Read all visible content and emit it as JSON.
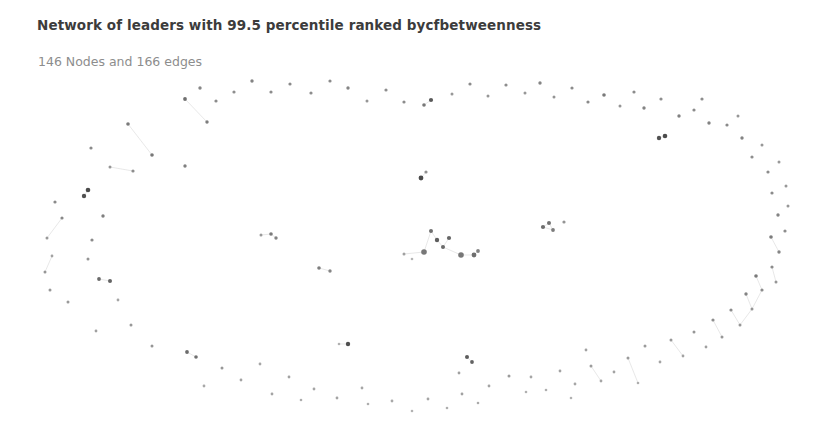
{
  "chart_data": {
    "type": "scatter",
    "title": "Network of leaders with 99.5 percentile ranked bycfbetweenness",
    "subtitle": "146 Nodes and 166 edges",
    "node_count": 146,
    "edge_count": 166,
    "layout": "circular-ring-with-central-cluster",
    "xlabel": "",
    "ylabel": "",
    "xlim": [
      0,
      830
    ],
    "ylim": [
      0,
      439
    ],
    "grid": false,
    "legend": "none",
    "node_color": "#6b6b6b",
    "node_color_light": "#b8b8b8",
    "edge_color": "#dedede",
    "background_color": "#ffffff",
    "nodes": [
      {
        "x": 128,
        "y": 124,
        "r": 1.8,
        "c": "#7a7a7a"
      },
      {
        "x": 91,
        "y": 148,
        "r": 1.6,
        "c": "#8a8a8a"
      },
      {
        "x": 185,
        "y": 99,
        "r": 1.9,
        "c": "#6f6f6f"
      },
      {
        "x": 207,
        "y": 122,
        "r": 1.7,
        "c": "#7d7d7d"
      },
      {
        "x": 152,
        "y": 155,
        "r": 1.8,
        "c": "#787878"
      },
      {
        "x": 110,
        "y": 167,
        "r": 1.5,
        "c": "#969696"
      },
      {
        "x": 185,
        "y": 166,
        "r": 1.7,
        "c": "#808080"
      },
      {
        "x": 133,
        "y": 171,
        "r": 1.6,
        "c": "#8d8d8d"
      },
      {
        "x": 88,
        "y": 190,
        "r": 2.3,
        "c": "#4a4a4a"
      },
      {
        "x": 84,
        "y": 196,
        "r": 2.2,
        "c": "#505050"
      },
      {
        "x": 55,
        "y": 202,
        "r": 1.6,
        "c": "#8a8a8a"
      },
      {
        "x": 62,
        "y": 218,
        "r": 1.6,
        "c": "#888888"
      },
      {
        "x": 103,
        "y": 216,
        "r": 1.7,
        "c": "#7f7f7f"
      },
      {
        "x": 47,
        "y": 238,
        "r": 1.5,
        "c": "#999999"
      },
      {
        "x": 92,
        "y": 240,
        "r": 1.6,
        "c": "#8b8b8b"
      },
      {
        "x": 52,
        "y": 256,
        "r": 1.4,
        "c": "#a2a2a2"
      },
      {
        "x": 88,
        "y": 259,
        "r": 1.5,
        "c": "#949494"
      },
      {
        "x": 45,
        "y": 272,
        "r": 1.5,
        "c": "#969696"
      },
      {
        "x": 99,
        "y": 279,
        "r": 1.9,
        "c": "#6a6a6a"
      },
      {
        "x": 110,
        "y": 281,
        "r": 2.0,
        "c": "#646464"
      },
      {
        "x": 50,
        "y": 290,
        "r": 1.5,
        "c": "#989898"
      },
      {
        "x": 68,
        "y": 302,
        "r": 1.5,
        "c": "#9a9a9a"
      },
      {
        "x": 118,
        "y": 300,
        "r": 1.4,
        "c": "#a5a5a5"
      },
      {
        "x": 131,
        "y": 325,
        "r": 1.5,
        "c": "#989898"
      },
      {
        "x": 96,
        "y": 331,
        "r": 1.4,
        "c": "#a0a0a0"
      },
      {
        "x": 152,
        "y": 346,
        "r": 1.5,
        "c": "#959595"
      },
      {
        "x": 187,
        "y": 352,
        "r": 1.9,
        "c": "#6c6c6c"
      },
      {
        "x": 196,
        "y": 357,
        "r": 1.8,
        "c": "#707070"
      },
      {
        "x": 222,
        "y": 368,
        "r": 1.5,
        "c": "#989898"
      },
      {
        "x": 241,
        "y": 380,
        "r": 1.4,
        "c": "#a3a3a3"
      },
      {
        "x": 204,
        "y": 386,
        "r": 1.4,
        "c": "#a8a8a8"
      },
      {
        "x": 272,
        "y": 394,
        "r": 1.4,
        "c": "#a4a4a4"
      },
      {
        "x": 260,
        "y": 364,
        "r": 1.4,
        "c": "#a6a6a6"
      },
      {
        "x": 289,
        "y": 377,
        "r": 1.4,
        "c": "#a2a2a2"
      },
      {
        "x": 314,
        "y": 389,
        "r": 1.4,
        "c": "#a5a5a5"
      },
      {
        "x": 301,
        "y": 400,
        "r": 1.3,
        "c": "#adadad"
      },
      {
        "x": 337,
        "y": 398,
        "r": 1.4,
        "c": "#a4a4a4"
      },
      {
        "x": 348,
        "y": 344,
        "r": 2.2,
        "c": "#4f4f4f"
      },
      {
        "x": 339,
        "y": 344,
        "r": 1.3,
        "c": "#b0b0b0"
      },
      {
        "x": 368,
        "y": 404,
        "r": 1.3,
        "c": "#aeaeae"
      },
      {
        "x": 362,
        "y": 388,
        "r": 1.4,
        "c": "#a6a6a6"
      },
      {
        "x": 392,
        "y": 401,
        "r": 1.4,
        "c": "#a8a8a8"
      },
      {
        "x": 412,
        "y": 411,
        "r": 1.3,
        "c": "#b2b2b2"
      },
      {
        "x": 428,
        "y": 399,
        "r": 1.4,
        "c": "#a5a5a5"
      },
      {
        "x": 447,
        "y": 408,
        "r": 1.3,
        "c": "#aeaeae"
      },
      {
        "x": 462,
        "y": 394,
        "r": 1.4,
        "c": "#a1a1a1"
      },
      {
        "x": 478,
        "y": 403,
        "r": 1.3,
        "c": "#aaaaaa"
      },
      {
        "x": 459,
        "y": 373,
        "r": 1.4,
        "c": "#a0a0a0"
      },
      {
        "x": 489,
        "y": 386,
        "r": 1.4,
        "c": "#a4a4a4"
      },
      {
        "x": 509,
        "y": 376,
        "r": 1.5,
        "c": "#9b9b9b"
      },
      {
        "x": 467,
        "y": 357,
        "r": 2.0,
        "c": "#5d5d5d"
      },
      {
        "x": 472,
        "y": 362,
        "r": 1.9,
        "c": "#636363"
      },
      {
        "x": 526,
        "y": 392,
        "r": 1.3,
        "c": "#b0b0b0"
      },
      {
        "x": 531,
        "y": 377,
        "r": 1.4,
        "c": "#a6a6a6"
      },
      {
        "x": 546,
        "y": 390,
        "r": 1.3,
        "c": "#aeaeae"
      },
      {
        "x": 560,
        "y": 371,
        "r": 1.4,
        "c": "#a3a3a3"
      },
      {
        "x": 575,
        "y": 384,
        "r": 1.4,
        "c": "#a6a6a6"
      },
      {
        "x": 571,
        "y": 398,
        "r": 1.3,
        "c": "#b1b1b1"
      },
      {
        "x": 591,
        "y": 366,
        "r": 1.5,
        "c": "#9c9c9c"
      },
      {
        "x": 601,
        "y": 381,
        "r": 1.4,
        "c": "#a5a5a5"
      },
      {
        "x": 586,
        "y": 350,
        "r": 1.4,
        "c": "#a1a1a1"
      },
      {
        "x": 614,
        "y": 372,
        "r": 1.4,
        "c": "#a3a3a3"
      },
      {
        "x": 628,
        "y": 358,
        "r": 1.5,
        "c": "#9a9a9a"
      },
      {
        "x": 638,
        "y": 383,
        "r": 1.3,
        "c": "#adadad"
      },
      {
        "x": 645,
        "y": 346,
        "r": 1.5,
        "c": "#9b9b9b"
      },
      {
        "x": 660,
        "y": 362,
        "r": 1.4,
        "c": "#a4a4a4"
      },
      {
        "x": 671,
        "y": 340,
        "r": 1.5,
        "c": "#999999"
      },
      {
        "x": 683,
        "y": 356,
        "r": 1.4,
        "c": "#a2a2a2"
      },
      {
        "x": 694,
        "y": 332,
        "r": 1.5,
        "c": "#969696"
      },
      {
        "x": 706,
        "y": 347,
        "r": 1.4,
        "c": "#a0a0a0"
      },
      {
        "x": 713,
        "y": 320,
        "r": 1.6,
        "c": "#8e8e8e"
      },
      {
        "x": 722,
        "y": 337,
        "r": 1.5,
        "c": "#979797"
      },
      {
        "x": 731,
        "y": 310,
        "r": 1.6,
        "c": "#8c8c8c"
      },
      {
        "x": 740,
        "y": 325,
        "r": 1.5,
        "c": "#969696"
      },
      {
        "x": 746,
        "y": 294,
        "r": 1.7,
        "c": "#838383"
      },
      {
        "x": 752,
        "y": 309,
        "r": 1.5,
        "c": "#949494"
      },
      {
        "x": 756,
        "y": 276,
        "r": 1.8,
        "c": "#7a7a7a"
      },
      {
        "x": 762,
        "y": 290,
        "r": 1.6,
        "c": "#8c8c8c"
      },
      {
        "x": 772,
        "y": 267,
        "r": 1.6,
        "c": "#8b8b8b"
      },
      {
        "x": 776,
        "y": 282,
        "r": 1.5,
        "c": "#969696"
      },
      {
        "x": 779,
        "y": 252,
        "r": 1.7,
        "c": "#858585"
      },
      {
        "x": 771,
        "y": 237,
        "r": 1.8,
        "c": "#7c7c7c"
      },
      {
        "x": 785,
        "y": 231,
        "r": 1.6,
        "c": "#8d8d8d"
      },
      {
        "x": 778,
        "y": 215,
        "r": 1.7,
        "c": "#848484"
      },
      {
        "x": 788,
        "y": 206,
        "r": 1.5,
        "c": "#979797"
      },
      {
        "x": 772,
        "y": 193,
        "r": 1.6,
        "c": "#8b8b8b"
      },
      {
        "x": 786,
        "y": 186,
        "r": 1.5,
        "c": "#989898"
      },
      {
        "x": 768,
        "y": 172,
        "r": 1.6,
        "c": "#8c8c8c"
      },
      {
        "x": 779,
        "y": 162,
        "r": 1.5,
        "c": "#999999"
      },
      {
        "x": 752,
        "y": 157,
        "r": 1.6,
        "c": "#8e8e8e"
      },
      {
        "x": 762,
        "y": 145,
        "r": 1.5,
        "c": "#979797"
      },
      {
        "x": 742,
        "y": 138,
        "r": 1.7,
        "c": "#848484"
      },
      {
        "x": 727,
        "y": 125,
        "r": 1.6,
        "c": "#8a8a8a"
      },
      {
        "x": 738,
        "y": 116,
        "r": 1.5,
        "c": "#969696"
      },
      {
        "x": 709,
        "y": 123,
        "r": 1.7,
        "c": "#828282"
      },
      {
        "x": 694,
        "y": 110,
        "r": 1.6,
        "c": "#8b8b8b"
      },
      {
        "x": 702,
        "y": 99,
        "r": 1.6,
        "c": "#8d8d8d"
      },
      {
        "x": 679,
        "y": 116,
        "r": 1.7,
        "c": "#818181"
      },
      {
        "x": 665,
        "y": 136,
        "r": 2.3,
        "c": "#4c4c4c"
      },
      {
        "x": 659,
        "y": 138,
        "r": 2.2,
        "c": "#525252"
      },
      {
        "x": 661,
        "y": 99,
        "r": 1.6,
        "c": "#8e8e8e"
      },
      {
        "x": 644,
        "y": 108,
        "r": 1.7,
        "c": "#848484"
      },
      {
        "x": 634,
        "y": 92,
        "r": 1.6,
        "c": "#8c8c8c"
      },
      {
        "x": 620,
        "y": 106,
        "r": 1.5,
        "c": "#959595"
      },
      {
        "x": 604,
        "y": 95,
        "r": 1.8,
        "c": "#7a7a7a"
      },
      {
        "x": 588,
        "y": 102,
        "r": 1.6,
        "c": "#8a8a8a"
      },
      {
        "x": 572,
        "y": 88,
        "r": 1.6,
        "c": "#8c8c8c"
      },
      {
        "x": 554,
        "y": 97,
        "r": 1.5,
        "c": "#949494"
      },
      {
        "x": 540,
        "y": 83,
        "r": 1.7,
        "c": "#858585"
      },
      {
        "x": 525,
        "y": 93,
        "r": 1.5,
        "c": "#979797"
      },
      {
        "x": 506,
        "y": 85,
        "r": 1.6,
        "c": "#8d8d8d"
      },
      {
        "x": 488,
        "y": 96,
        "r": 1.5,
        "c": "#969696"
      },
      {
        "x": 470,
        "y": 84,
        "r": 1.6,
        "c": "#8b8b8b"
      },
      {
        "x": 452,
        "y": 94,
        "r": 1.5,
        "c": "#989898"
      },
      {
        "x": 431,
        "y": 100,
        "r": 2.1,
        "c": "#5a5a5a"
      },
      {
        "x": 424,
        "y": 105,
        "r": 1.8,
        "c": "#787878"
      },
      {
        "x": 404,
        "y": 102,
        "r": 1.6,
        "c": "#8c8c8c"
      },
      {
        "x": 386,
        "y": 90,
        "r": 1.6,
        "c": "#8e8e8e"
      },
      {
        "x": 367,
        "y": 101,
        "r": 1.5,
        "c": "#969696"
      },
      {
        "x": 348,
        "y": 88,
        "r": 1.7,
        "c": "#858585"
      },
      {
        "x": 330,
        "y": 81,
        "r": 1.6,
        "c": "#8b8b8b"
      },
      {
        "x": 311,
        "y": 93,
        "r": 1.6,
        "c": "#8d8d8d"
      },
      {
        "x": 290,
        "y": 84,
        "r": 1.6,
        "c": "#8a8a8a"
      },
      {
        "x": 271,
        "y": 92,
        "r": 1.6,
        "c": "#8c8c8c"
      },
      {
        "x": 252,
        "y": 81,
        "r": 1.7,
        "c": "#838383"
      },
      {
        "x": 234,
        "y": 92,
        "r": 1.6,
        "c": "#8e8e8e"
      },
      {
        "x": 216,
        "y": 101,
        "r": 1.6,
        "c": "#8b8b8b"
      },
      {
        "x": 200,
        "y": 88,
        "r": 1.7,
        "c": "#868686"
      },
      {
        "x": 421,
        "y": 178,
        "r": 2.4,
        "c": "#4a4a4a"
      },
      {
        "x": 426,
        "y": 172,
        "r": 1.6,
        "c": "#8f8f8f"
      },
      {
        "x": 431,
        "y": 231,
        "r": 2.0,
        "c": "#707070"
      },
      {
        "x": 437,
        "y": 240,
        "r": 2.2,
        "c": "#5e5e5e"
      },
      {
        "x": 443,
        "y": 247,
        "r": 2.0,
        "c": "#6a6a6a"
      },
      {
        "x": 449,
        "y": 238,
        "r": 2.1,
        "c": "#666666"
      },
      {
        "x": 424,
        "y": 252,
        "r": 2.8,
        "c": "#777777"
      },
      {
        "x": 461,
        "y": 255,
        "r": 2.8,
        "c": "#777777"
      },
      {
        "x": 474,
        "y": 255,
        "r": 2.4,
        "c": "#6e6e6e"
      },
      {
        "x": 478,
        "y": 251,
        "r": 1.9,
        "c": "#828282"
      },
      {
        "x": 404,
        "y": 254,
        "r": 1.5,
        "c": "#a0a0a0"
      },
      {
        "x": 412,
        "y": 259,
        "r": 1.3,
        "c": "#b4b4b4"
      },
      {
        "x": 271,
        "y": 234,
        "r": 1.8,
        "c": "#7b7b7b"
      },
      {
        "x": 276,
        "y": 238,
        "r": 1.7,
        "c": "#838383"
      },
      {
        "x": 261,
        "y": 235,
        "r": 1.5,
        "c": "#9a9a9a"
      },
      {
        "x": 319,
        "y": 268,
        "r": 1.8,
        "c": "#7e7e7e"
      },
      {
        "x": 330,
        "y": 271,
        "r": 1.7,
        "c": "#858585"
      },
      {
        "x": 543,
        "y": 227,
        "r": 2.1,
        "c": "#6d6d6d"
      },
      {
        "x": 549,
        "y": 223,
        "r": 2.0,
        "c": "#727272"
      },
      {
        "x": 553,
        "y": 230,
        "r": 1.9,
        "c": "#7c7c7c"
      },
      {
        "x": 564,
        "y": 222,
        "r": 1.6,
        "c": "#949494"
      }
    ],
    "edges": [
      {
        "x1": 88,
        "y1": 190,
        "x2": 84,
        "y2": 196
      },
      {
        "x1": 99,
        "y1": 279,
        "x2": 110,
        "y2": 281
      },
      {
        "x1": 187,
        "y1": 352,
        "x2": 196,
        "y2": 357
      },
      {
        "x1": 339,
        "y1": 344,
        "x2": 348,
        "y2": 344
      },
      {
        "x1": 467,
        "y1": 357,
        "x2": 472,
        "y2": 362
      },
      {
        "x1": 665,
        "y1": 136,
        "x2": 659,
        "y2": 138
      },
      {
        "x1": 431,
        "y1": 100,
        "x2": 424,
        "y2": 105
      },
      {
        "x1": 421,
        "y1": 178,
        "x2": 426,
        "y2": 172
      },
      {
        "x1": 431,
        "y1": 231,
        "x2": 437,
        "y2": 240
      },
      {
        "x1": 437,
        "y1": 240,
        "x2": 443,
        "y2": 247
      },
      {
        "x1": 443,
        "y1": 247,
        "x2": 449,
        "y2": 238
      },
      {
        "x1": 443,
        "y1": 247,
        "x2": 461,
        "y2": 255
      },
      {
        "x1": 431,
        "y1": 231,
        "x2": 424,
        "y2": 252
      },
      {
        "x1": 461,
        "y1": 255,
        "x2": 474,
        "y2": 255
      },
      {
        "x1": 474,
        "y1": 255,
        "x2": 478,
        "y2": 251
      },
      {
        "x1": 404,
        "y1": 254,
        "x2": 424,
        "y2": 252
      },
      {
        "x1": 271,
        "y1": 234,
        "x2": 276,
        "y2": 238
      },
      {
        "x1": 261,
        "y1": 235,
        "x2": 271,
        "y2": 234
      },
      {
        "x1": 319,
        "y1": 268,
        "x2": 330,
        "y2": 271
      },
      {
        "x1": 543,
        "y1": 227,
        "x2": 549,
        "y2": 223
      },
      {
        "x1": 549,
        "y1": 223,
        "x2": 553,
        "y2": 230
      },
      {
        "x1": 543,
        "y1": 227,
        "x2": 553,
        "y2": 230
      },
      {
        "x1": 756,
        "y1": 276,
        "x2": 762,
        "y2": 290
      },
      {
        "x1": 762,
        "y1": 290,
        "x2": 752,
        "y2": 309
      },
      {
        "x1": 752,
        "y1": 309,
        "x2": 740,
        "y2": 325
      },
      {
        "x1": 772,
        "y1": 267,
        "x2": 776,
        "y2": 282
      },
      {
        "x1": 779,
        "y1": 252,
        "x2": 771,
        "y2": 237
      },
      {
        "x1": 746,
        "y1": 294,
        "x2": 752,
        "y2": 309
      },
      {
        "x1": 731,
        "y1": 310,
        "x2": 740,
        "y2": 325
      },
      {
        "x1": 713,
        "y1": 320,
        "x2": 722,
        "y2": 337
      },
      {
        "x1": 128,
        "y1": 124,
        "x2": 152,
        "y2": 155
      },
      {
        "x1": 110,
        "y1": 167,
        "x2": 133,
        "y2": 171
      },
      {
        "x1": 185,
        "y1": 99,
        "x2": 207,
        "y2": 122
      },
      {
        "x1": 62,
        "y1": 218,
        "x2": 47,
        "y2": 238
      },
      {
        "x1": 52,
        "y1": 256,
        "x2": 45,
        "y2": 272
      },
      {
        "x1": 591,
        "y1": 366,
        "x2": 601,
        "y2": 381
      },
      {
        "x1": 628,
        "y1": 358,
        "x2": 638,
        "y2": 383
      },
      {
        "x1": 671,
        "y1": 340,
        "x2": 683,
        "y2": 356
      }
    ]
  }
}
